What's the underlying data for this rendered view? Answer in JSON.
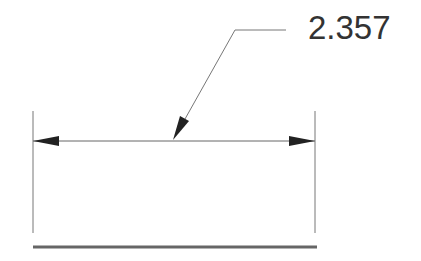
{
  "diagram": {
    "type": "linear-dimension",
    "dimension_value": "2.357",
    "colors": {
      "line": "#555555",
      "arrow": "#222222",
      "text": "#333333",
      "base_line": "#666666"
    }
  }
}
